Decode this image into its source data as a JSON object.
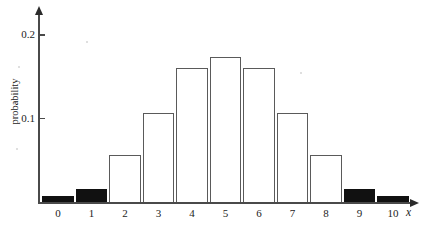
{
  "chart_data": {
    "type": "bar",
    "title": "",
    "subtitle": "",
    "xlabel": "x",
    "ylabel": "probability",
    "categories": [
      "0",
      "1",
      "2",
      "3",
      "4",
      "5",
      "6",
      "7",
      "8",
      "9",
      "10"
    ],
    "values": [
      0.008,
      0.016,
      0.057,
      0.107,
      0.161,
      0.174,
      0.161,
      0.107,
      0.057,
      0.016,
      0.008
    ],
    "bar_styles": [
      "filled",
      "filled",
      "outlined",
      "outlined",
      "outlined",
      "outlined",
      "outlined",
      "outlined",
      "outlined",
      "filled",
      "filled"
    ],
    "xlim": [
      -0.6,
      10.6
    ],
    "ylim": [
      0,
      0.225
    ],
    "y_ticks": [
      0.1,
      0.2
    ],
    "y_tick_labels": [
      "0.1",
      "0.2"
    ],
    "x_ticks": [
      0,
      1,
      2,
      3,
      4,
      5,
      6,
      7,
      8,
      9,
      10
    ],
    "grid": false,
    "legend": false,
    "legend_position": "none",
    "axis_arrows": true,
    "annotations": []
  },
  "colors": {
    "axis": "#4a4a4a",
    "arrow": "#2b2b2b",
    "bar_outline": "#5a5a5a",
    "bar_fill_dark": "#111111",
    "bar_fill_light": "#ffffff",
    "text": "#232323",
    "background": "#ffffff"
  },
  "axis_titles": {
    "x": "x",
    "y": "probability"
  }
}
